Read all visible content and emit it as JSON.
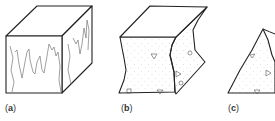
{
  "figure": {
    "panels": [
      {
        "id": "a",
        "label_open": "(",
        "label_letter": "a",
        "label_close": ")",
        "description": "cube with jagged vertical fracture lines on front and side faces"
      },
      {
        "id": "b",
        "label_open": "(",
        "label_letter": "b",
        "label_close": ")",
        "description": "block with concave wavy sides, stippled fill and small triangle/circle symbols"
      },
      {
        "id": "c",
        "label_open": "(",
        "label_letter": "c",
        "label_close": ")",
        "description": "triangular wedge with stippled fill and symbols"
      }
    ]
  },
  "colors": {
    "outline": "#222222",
    "fracture": "#666666",
    "stipple": "#c8c8c8",
    "symbols": "#555555"
  }
}
